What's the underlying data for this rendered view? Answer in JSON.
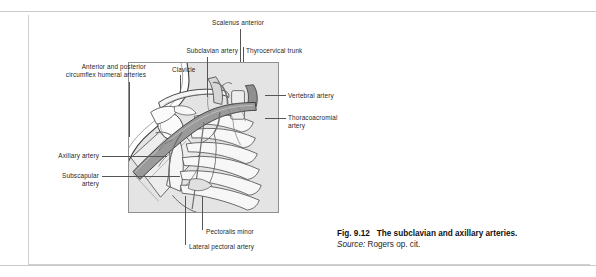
{
  "figure": {
    "caption": {
      "figure_number": "Fig. 9.12",
      "title": "The subclavian and axillary arteries.",
      "source_label": "Source:",
      "source_text": "Rogers op. cit."
    },
    "labels": {
      "scalenus_anterior": "Scalenus anterior",
      "subclavian_artery": "Subclavian artery",
      "thyrocervical_trunk": "Thyrocervical trunk",
      "clavicle": "Clavicle",
      "circumflex_humeral": "Anterior and posterior\ncircumflex humeral arteries",
      "vertebral_artery": "Vertebral artery",
      "thoracoacromial_artery": "Thoracoacromial\nartery",
      "axillary_artery": "Axillary artery",
      "subscapular_artery": "Subscapular\nartery",
      "pectoralis_minor": "Pectoralis minor",
      "lateral_pectoral_artery": "Lateral pectoral artery"
    },
    "colors": {
      "artery_fill": "#9a9a9a",
      "bone_fill": "#f2f2f2",
      "muscle_fill": "#d6d6d6",
      "background_tint": "#e4e4e4",
      "outline": "#3a3a3a",
      "leader_line": "#555555",
      "panel_border": "#8f8f8f",
      "frame_border": "#d0d0d0",
      "rule": "#c9c9c9"
    }
  }
}
